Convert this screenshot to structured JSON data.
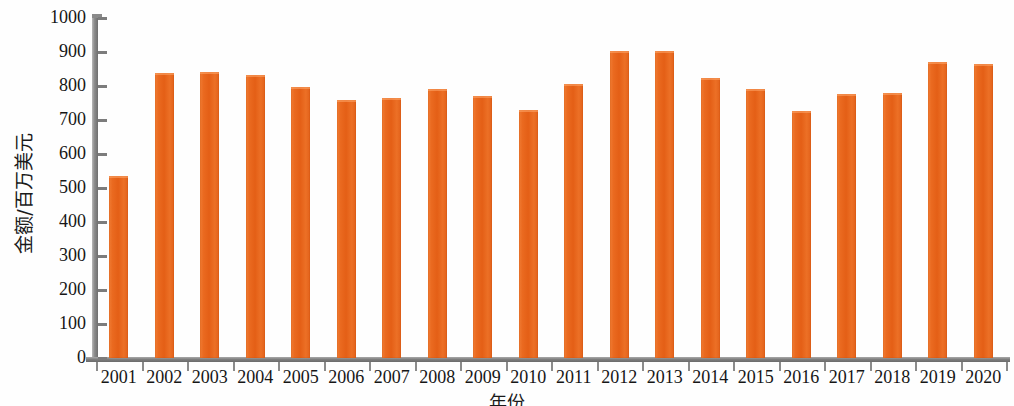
{
  "chart_data": {
    "type": "bar",
    "title": "",
    "subtitle": "",
    "xlabel": "年份",
    "ylabel": "金额/百万美元",
    "categories": [
      "2001",
      "2002",
      "2003",
      "2004",
      "2005",
      "2006",
      "2007",
      "2008",
      "2009",
      "2010",
      "2011",
      "2012",
      "2013",
      "2014",
      "2015",
      "2016",
      "2017",
      "2018",
      "2019",
      "2020"
    ],
    "values": [
      535,
      838,
      841,
      832,
      797,
      759,
      765,
      791,
      771,
      729,
      806,
      903,
      903,
      824,
      791,
      726,
      776,
      779,
      871,
      865
    ],
    "series": [
      {
        "name": "金额",
        "values": [
          535,
          838,
          841,
          832,
          797,
          759,
          765,
          791,
          771,
          729,
          806,
          903,
          903,
          824,
          791,
          726,
          776,
          779,
          871,
          865
        ]
      }
    ],
    "ylim": [
      0,
      1000
    ],
    "ytick_values": [
      0,
      100,
      200,
      300,
      400,
      500,
      600,
      700,
      800,
      900,
      1000
    ],
    "ytick_labels": [
      "0",
      "100",
      "200",
      "300",
      "400",
      "500",
      "600",
      "700",
      "800",
      "900",
      "1000"
    ],
    "grid": false,
    "legend": false,
    "legend_position": "none",
    "bar_color": "#E8601C",
    "axis_color": "#7d7d7d",
    "text_color": "#161616",
    "background": "#ffffff"
  },
  "axis": {
    "y_title": "金额/百万美元",
    "x_title": "年份"
  }
}
